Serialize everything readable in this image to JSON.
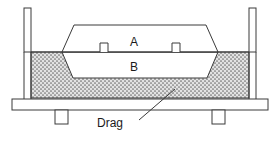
{
  "diagram": {
    "type": "engineering-cross-section",
    "labels": {
      "pattern_upper": "A",
      "pattern_lower": "B",
      "drag": "Drag"
    },
    "colors": {
      "outline": "#3a3a3a",
      "sand_fill": "#d8d8d8",
      "sand_dot": "#6e6e6e",
      "pattern_fill": "#ffffff",
      "flask_fill": "#ffffff",
      "background": "#ffffff",
      "text": "#1a1a1a"
    },
    "parts": [
      {
        "name": "left-post",
        "label": ""
      },
      {
        "name": "right-post",
        "label": ""
      },
      {
        "name": "base-plate",
        "label": ""
      },
      {
        "name": "left-leg",
        "label": ""
      },
      {
        "name": "right-leg",
        "label": ""
      },
      {
        "name": "sand-body",
        "label": ""
      },
      {
        "name": "pattern-upper-half",
        "label": "A"
      },
      {
        "name": "pattern-lower-half",
        "label": "B"
      },
      {
        "name": "left-notch",
        "label": ""
      },
      {
        "name": "right-notch",
        "label": ""
      },
      {
        "name": "parting-line",
        "label": ""
      },
      {
        "name": "leader-line",
        "label": ""
      }
    ],
    "geometry": {
      "parting_line_y": 52,
      "pattern_top_y": 25,
      "pattern_bottom_y": 78,
      "sand_top_y": 52,
      "sand_bottom_y": 98,
      "base_plate_y": 99,
      "base_plate_height": 10
    }
  }
}
